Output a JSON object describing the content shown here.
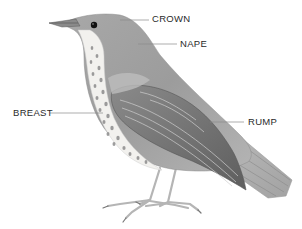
{
  "figure": {
    "background_color": "#ffffff",
    "label_color": "#2a2a2a",
    "leader_line_color": "#8a8a8a",
    "plumage_colors": {
      "upperparts": "#9a9a9a",
      "wing_dark": "#6e6e6e",
      "breast_base": "#f2f1ee",
      "breast_spots": "#8c8c8c",
      "legs": "#b8b8b8",
      "eye": "#111111"
    }
  },
  "labels": {
    "crown": "CROWN",
    "nape": "NAPE",
    "breast": "BREAST",
    "rump": "RUMP"
  }
}
